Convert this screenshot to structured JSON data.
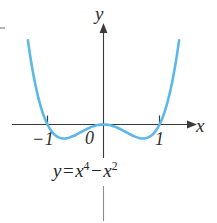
{
  "figure": {
    "kind": "cartesian-graph",
    "background_color": "#ffffff",
    "curve_color": "#5bb8e8",
    "axis_color": "#3a3a3a",
    "text_color": "#2b2b2b"
  },
  "axes": {
    "x_label": "x",
    "y_label": "y",
    "tick_labels": {
      "neg_one": "−1",
      "zero": "0",
      "one": "1"
    }
  },
  "equation": {
    "lhs": "y",
    "equals": "=",
    "term1_base": "x",
    "term1_exp": "4",
    "operator": "−",
    "term2_base": "x",
    "term2_exp": "2",
    "plain": "y = x⁴ − x²"
  },
  "chart_data": {
    "type": "line",
    "title": "",
    "subtitle": "",
    "xlabel": "x",
    "ylabel": "y",
    "function": "y = x^4 - x^2",
    "legend": [],
    "legend_position": "none",
    "grid": false,
    "xlim": [
      -1.45,
      1.45
    ],
    "ylim": [
      -0.55,
      3.4
    ],
    "xticks": [
      -1,
      0,
      1
    ],
    "xticklabels": [
      "−1",
      "0",
      "1"
    ],
    "yticks": [],
    "yticklabels": [],
    "roots": [
      -1,
      0,
      1
    ],
    "local_minima": [
      {
        "x": -0.7071,
        "y": -0.25
      },
      {
        "x": 0.7071,
        "y": -0.25
      }
    ],
    "local_maxima": [
      {
        "x": 0,
        "y": 0
      }
    ],
    "series": [
      {
        "name": "y = x^4 - x^2",
        "color": "#5bb8e8",
        "x": [
          -1.35,
          -1.3,
          -1.25,
          -1.2,
          -1.15,
          -1.1,
          -1.05,
          -1.0,
          -0.95,
          -0.9,
          -0.85,
          -0.8,
          -0.75,
          -0.7,
          -0.65,
          -0.6,
          -0.55,
          -0.5,
          -0.45,
          -0.4,
          -0.35,
          -0.3,
          -0.25,
          -0.2,
          -0.15,
          -0.1,
          -0.05,
          0.0,
          0.05,
          0.1,
          0.15,
          0.2,
          0.25,
          0.3,
          0.35,
          0.4,
          0.45,
          0.5,
          0.55,
          0.6,
          0.65,
          0.7,
          0.75,
          0.8,
          0.85,
          0.9,
          0.95,
          1.0,
          1.05,
          1.1,
          1.15,
          1.2,
          1.25,
          1.3,
          1.35
        ],
        "y": [
          1.502,
          1.167,
          0.879,
          0.634,
          0.425,
          0.254,
          0.112,
          0.0,
          -0.088,
          -0.154,
          -0.2,
          -0.23,
          -0.246,
          -0.25,
          -0.244,
          -0.23,
          -0.211,
          -0.188,
          -0.161,
          -0.134,
          -0.108,
          -0.081,
          -0.059,
          -0.038,
          -0.022,
          -0.01,
          -0.002,
          0.0,
          -0.002,
          -0.01,
          -0.022,
          -0.038,
          -0.059,
          -0.081,
          -0.108,
          -0.134,
          -0.161,
          -0.188,
          -0.211,
          -0.23,
          -0.244,
          -0.25,
          -0.246,
          -0.23,
          -0.2,
          -0.154,
          -0.088,
          0.0,
          0.112,
          0.254,
          0.425,
          0.634,
          0.879,
          1.167,
          1.502
        ]
      }
    ]
  }
}
